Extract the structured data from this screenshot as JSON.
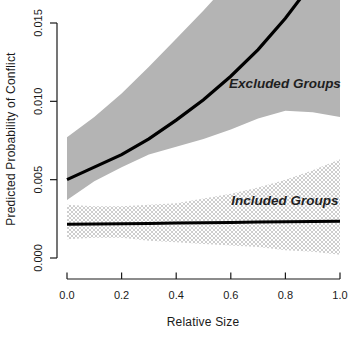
{
  "chart_data": {
    "type": "line",
    "title": "",
    "xlabel": "Relative Size",
    "ylabel": "Predicted Probability of Conflict",
    "xlim": [
      0.0,
      1.0
    ],
    "ylim": [
      0.0,
      0.015
    ],
    "grid": false,
    "x_tick_labels": [
      "0.0",
      "0.2",
      "0.4",
      "0.6",
      "0.8",
      "1.0"
    ],
    "x_tick_values": [
      0.0,
      0.2,
      0.4,
      0.6,
      0.8,
      1.0
    ],
    "y_tick_labels": [
      "0.000",
      "0.005",
      "0.010",
      "0.015"
    ],
    "y_tick_values": [
      0.0,
      0.005,
      0.01,
      0.015
    ],
    "x": [
      0,
      0.1,
      0.2,
      0.3,
      0.4,
      0.5,
      0.6,
      0.7,
      0.8,
      0.9,
      1.0
    ],
    "series": [
      {
        "name": "Excluded Groups",
        "values": [
          0.005,
          0.0058,
          0.0066,
          0.0076,
          0.0088,
          0.0101,
          0.0116,
          0.0133,
          0.0153,
          0.0176,
          0.0203
        ],
        "band_upper": [
          0.0077,
          0.009,
          0.0105,
          0.0122,
          0.014,
          0.0158,
          0.0177,
          0.0196,
          0.0215,
          0.0235,
          0.0255
        ],
        "band_lower": [
          0.0037,
          0.0049,
          0.0058,
          0.0066,
          0.0071,
          0.0076,
          0.0082,
          0.0089,
          0.0094,
          0.0093,
          0.009
        ],
        "band_style": "solid",
        "band_color": "#b4b4b4",
        "line_color": "#000000"
      },
      {
        "name": "Included Groups",
        "values": [
          0.00215,
          0.00217,
          0.00219,
          0.00221,
          0.00223,
          0.00225,
          0.00227,
          0.00229,
          0.00231,
          0.00233,
          0.00235
        ],
        "band_upper": [
          0.0034,
          0.0033,
          0.0033,
          0.0034,
          0.0035,
          0.0038,
          0.0041,
          0.0045,
          0.005,
          0.0056,
          0.0063
        ],
        "band_lower": [
          0.0012,
          0.0013,
          0.0013,
          0.0011,
          0.001,
          0.0009,
          0.0008,
          0.0007,
          0.0005,
          0.0004,
          0.0002
        ],
        "band_style": "crosshatch",
        "band_color": "#b9b9b9",
        "line_color": "#000000"
      }
    ],
    "legend_position": "in-plot-annotations",
    "axis_color": "#1a1a1a"
  }
}
